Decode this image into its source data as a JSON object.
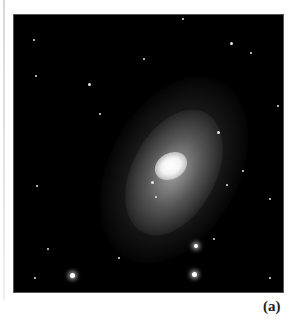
{
  "figure": {
    "label": "(a)",
    "image_subject": "spiral-galaxy-photograph",
    "background_color": "#000000",
    "core_color": "#ffffff"
  }
}
